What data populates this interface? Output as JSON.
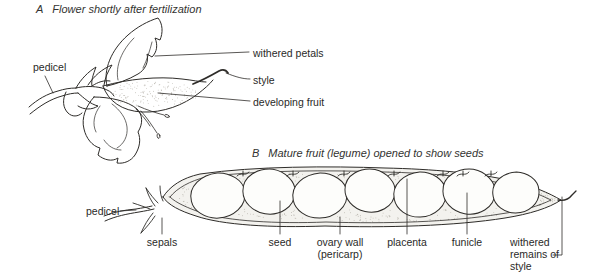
{
  "colors": {
    "ink": "#2e2c29",
    "text": "#2a2a28",
    "background": "#ffffff",
    "stipple": "#a39f96",
    "seed_fill": "#fdfdfb",
    "pod_fill": "#f3f2ee"
  },
  "panel_a": {
    "index_letter": "A",
    "title": "Flower shortly after fertilization",
    "labels": {
      "pedicel": "pedicel",
      "withered_petals": "withered petals",
      "style": "style",
      "developing_fruit": "developing fruit"
    }
  },
  "panel_b": {
    "index_letter": "B",
    "title": "Mature fruit (legume) opened to show seeds",
    "labels": {
      "pedicel": "pedicel",
      "sepals": "sepals",
      "seed": "seed",
      "ovary_wall": "ovary wall (pericarp)",
      "placenta": "placenta",
      "funicle": "funicle",
      "withered_remains": "withered remains of style"
    }
  }
}
